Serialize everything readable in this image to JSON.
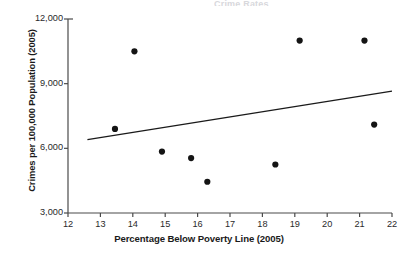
{
  "title_fragment": "Crime Rates",
  "chart_data": {
    "type": "scatter",
    "title": "",
    "xlabel": "Percentage Below Poverty Line (2005)",
    "ylabel": "Crimes per 100,000 Population (2005)",
    "xlim": [
      12,
      22
    ],
    "ylim": [
      3000,
      12000
    ],
    "xticks": [
      12,
      13,
      14,
      15,
      16,
      17,
      18,
      19,
      20,
      21,
      22
    ],
    "xtick_labels": [
      "12",
      "13",
      "14",
      "15",
      "16",
      "17",
      "18",
      "19",
      "20",
      "21",
      "22"
    ],
    "yticks": [
      3000,
      6000,
      9000,
      12000
    ],
    "ytick_labels": [
      "3,000",
      "6,000",
      "9,000",
      "12,000"
    ],
    "grid": false,
    "legend": false,
    "marker_color": "#141414",
    "marker_size": 5,
    "line_color": "#1a1a1a",
    "axis_color": "#4a4a4a",
    "points": [
      {
        "x": 13.45,
        "y": 6900
      },
      {
        "x": 14.05,
        "y": 10500
      },
      {
        "x": 14.9,
        "y": 5850
      },
      {
        "x": 15.8,
        "y": 5550
      },
      {
        "x": 16.3,
        "y": 4450
      },
      {
        "x": 18.4,
        "y": 5250
      },
      {
        "x": 19.15,
        "y": 11000
      },
      {
        "x": 21.15,
        "y": 11000
      },
      {
        "x": 21.45,
        "y": 7100
      }
    ],
    "trend_line": {
      "x_start": 12.6,
      "y_start": 6400,
      "x_end": 22.0,
      "y_end": 8650
    }
  }
}
